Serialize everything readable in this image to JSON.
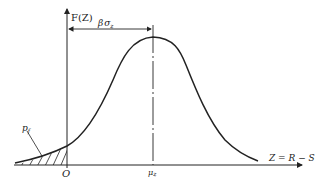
{
  "diagram": {
    "type": "probability-density-curve",
    "y_axis_label": "F(Z)",
    "x_axis_label": "Z = R − S",
    "origin_label": "O",
    "mean_label": "μz",
    "distance_label": "βσz",
    "failure_prob_label": "p_f",
    "colors": {
      "stroke": "#222222",
      "background": "#ffffff"
    }
  },
  "labels": {
    "fz": "F(Z)",
    "zrs": "Z = R − S",
    "o": "O",
    "mu_main": "μ",
    "mu_sub": "z",
    "beta": "β",
    "sigma": "σ",
    "sigma_sub": "z",
    "pf_main": "p",
    "pf_sub": "f"
  }
}
